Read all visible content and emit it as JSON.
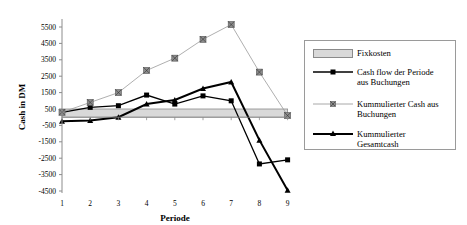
{
  "chart_data": {
    "type": "line",
    "title": "",
    "xlabel": "Periode",
    "ylabel": "Cash in DM",
    "x": [
      1,
      2,
      3,
      4,
      5,
      6,
      7,
      8,
      9
    ],
    "xticks": [
      "1",
      "2",
      "3",
      "4",
      "5",
      "6",
      "7",
      "8",
      "9"
    ],
    "yticks": [
      "5500",
      "4500",
      "3500",
      "2500",
      "1500",
      "500",
      "-500",
      "-1500",
      "-2500",
      "-3500",
      "-4500"
    ],
    "ylim": [
      -4500,
      5500
    ],
    "grid": false,
    "legend_position": "right",
    "series": [
      {
        "name": "Fixkosten",
        "kind": "band",
        "values": [
          500,
          500,
          500,
          500,
          500,
          500,
          500,
          500,
          500
        ],
        "color": "#d9d9d9"
      },
      {
        "name": "Cash flow der Periode aus Buchungen",
        "kind": "line",
        "marker": "square",
        "values": [
          300,
          600,
          700,
          1350,
          800,
          1300,
          1000,
          -2850,
          -2600
        ],
        "color": "#000000"
      },
      {
        "name": "Kummulierter Cash aus Buchungen",
        "kind": "line",
        "marker": "square-x",
        "values": [
          300,
          900,
          1500,
          2850,
          3600,
          4750,
          5650,
          2750,
          100
        ],
        "color": "#8c8c8c"
      },
      {
        "name": "Kummulierter Gesamtcash",
        "kind": "line",
        "marker": "triangle",
        "values": [
          -250,
          -200,
          0,
          800,
          1050,
          1750,
          2150,
          -1400,
          -4450
        ],
        "color": "#000000"
      }
    ]
  },
  "legend": {
    "items": [
      {
        "line1": "Fixkosten",
        "line2": ""
      },
      {
        "line1": "Cash flow der Periode",
        "line2": "aus Buchungen"
      },
      {
        "line1": "Kummulierter Cash aus",
        "line2": "Buchungen"
      },
      {
        "line1": "Kummulierter",
        "line2": "Gesamtcash"
      }
    ]
  },
  "axes": {
    "x_title": "Periode",
    "y_title": "Cash in DM"
  }
}
